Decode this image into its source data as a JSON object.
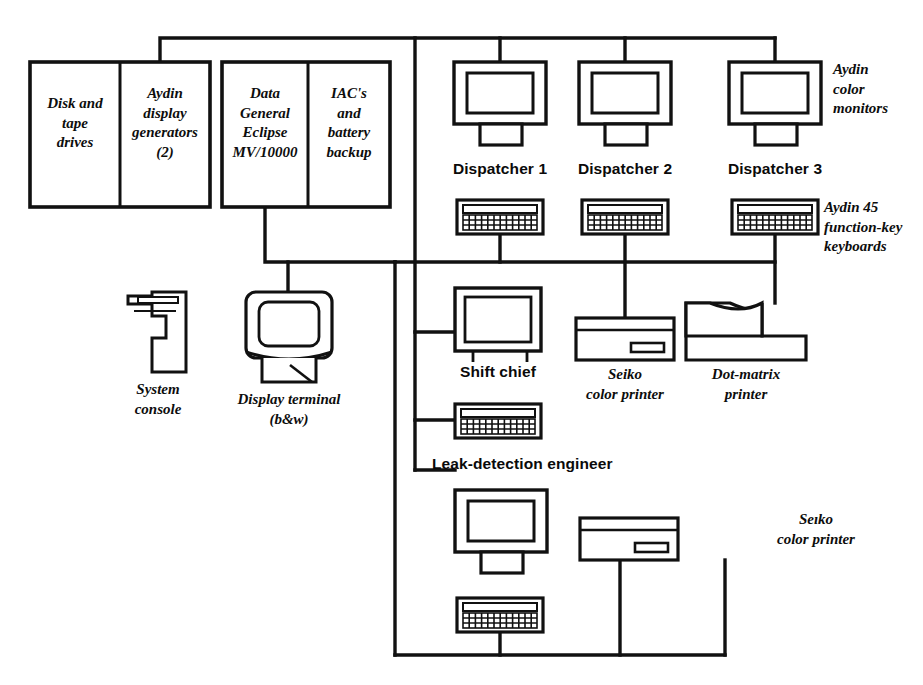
{
  "diagram": {
    "stroke_color": "#111111",
    "background_color": "#ffffff"
  },
  "cabinets": [
    {
      "name": "peripherals-cabinet",
      "compartments": [
        {
          "name": "disk-tape-drives",
          "lines": [
            "Disk and",
            "tape",
            "drives"
          ]
        },
        {
          "name": "aydin-display-generators",
          "lines": [
            "Aydin",
            "display",
            "generators",
            "(2)"
          ]
        }
      ]
    },
    {
      "name": "host-cabinet",
      "compartments": [
        {
          "name": "data-general-eclipse",
          "lines": [
            "Data",
            "General",
            "Eclipse",
            "MV/10000"
          ]
        },
        {
          "name": "iac-battery-backup",
          "lines": [
            "IAC's",
            "and",
            "battery",
            "backup"
          ]
        }
      ]
    }
  ],
  "workstations": [
    {
      "name": "dispatcher-1",
      "label": "Dispatcher 1"
    },
    {
      "name": "dispatcher-2",
      "label": "Dispatcher 2"
    },
    {
      "name": "dispatcher-3",
      "label": "Dispatcher 3"
    }
  ],
  "annotations": {
    "monitors": [
      "Aydin",
      "color",
      "monitors"
    ],
    "keyboards": [
      "Aydin 45",
      "function-key",
      "keyboards"
    ],
    "system_console": [
      "System",
      "console"
    ],
    "display_terminal": [
      "Display terminal",
      "(b&w)"
    ],
    "seiko_printer_upper": [
      "Seiko",
      "color printer"
    ],
    "dot_matrix_printer": [
      "Dot-matrix",
      "printer"
    ],
    "seiko_printer_lower": [
      "Seıko",
      "color printer"
    ]
  },
  "stations": {
    "shift_chief": "Shift chief",
    "leak_detection_engineer": "Leak-detection engineer"
  }
}
